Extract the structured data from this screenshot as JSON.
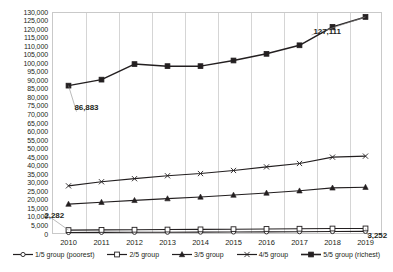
{
  "chart_data": {
    "type": "line",
    "title": "",
    "subtitle": "",
    "xlabel": "",
    "ylabel": "",
    "x": [
      "2010",
      "2011",
      "2012",
      "2013",
      "2014",
      "2015",
      "2016",
      "2017",
      "2018",
      "2019"
    ],
    "categories": [
      "2010",
      "2011",
      "2012",
      "2013",
      "2014",
      "2015",
      "2016",
      "2017",
      "2018",
      "2019"
    ],
    "ylim": [
      0,
      130000
    ],
    "ytick_step": 5000,
    "yticks": [
      "130,000",
      "125,000",
      "120,000",
      "115,000",
      "110,000",
      "105,000",
      "100,000",
      "95,000",
      "90,000",
      "85,000",
      "80,000",
      "75,000",
      "70,000",
      "65,000",
      "60,000",
      "55,000",
      "50,000",
      "45,000",
      "40,000",
      "35,000",
      "30,000",
      "25,000",
      "20,000",
      "15,000",
      "10,000",
      "5,000",
      "0"
    ],
    "ytick_values": [
      130000,
      125000,
      120000,
      115000,
      110000,
      105000,
      100000,
      95000,
      90000,
      85000,
      80000,
      75000,
      70000,
      65000,
      60000,
      55000,
      50000,
      45000,
      40000,
      35000,
      30000,
      25000,
      20000,
      15000,
      10000,
      5000,
      0
    ],
    "grid": {
      "vertical": true,
      "horizontal": false
    },
    "legend_position": "bottom",
    "series": [
      {
        "name": "1/5 group (poorest)",
        "marker": "open-circle",
        "color": "#231f20",
        "values": [
          900,
          950,
          1000,
          1050,
          1100,
          1180,
          1250,
          1350,
          1450,
          1550
        ]
      },
      {
        "name": "2/5 group",
        "marker": "open-square",
        "color": "#231f20",
        "values": [
          2282,
          2400,
          2500,
          2600,
          2700,
          2820,
          2950,
          3080,
          3200,
          3252
        ]
      },
      {
        "name": "3/5 group",
        "marker": "filled-triangle",
        "color": "#231f20",
        "values": [
          17500,
          18600,
          19700,
          20700,
          21700,
          22800,
          24000,
          25300,
          27000,
          27400
        ]
      },
      {
        "name": "4/5 group",
        "marker": "cross-bar",
        "color": "#231f20",
        "values": [
          28200,
          30600,
          32400,
          34100,
          35400,
          37200,
          39300,
          41300,
          45000,
          45600
        ]
      },
      {
        "name": "5/5 group (richest)",
        "marker": "filled-square",
        "color": "#231f20",
        "values": [
          86883,
          90400,
          99500,
          98300,
          98300,
          101600,
          105500,
          110500,
          121300,
          127111
        ]
      }
    ],
    "annotations": [
      {
        "text": "86,883",
        "series": "5/5 group (richest)",
        "x": "2010",
        "value": 86883
      },
      {
        "text": "127,111",
        "series": "5/5 group (richest)",
        "x": "2019",
        "value": 127111
      },
      {
        "text": "2,282",
        "series": "2/5 group",
        "x": "2010",
        "value": 2282
      },
      {
        "text": "3,252",
        "series": "2/5 group",
        "x": "2019",
        "value": 3252
      }
    ]
  },
  "legend": {
    "items": [
      {
        "label": "1/5 group (poorest)",
        "marker": "open-circle"
      },
      {
        "label": "2/5 group",
        "marker": "open-square"
      },
      {
        "label": "3/5 group",
        "marker": "filled-triangle"
      },
      {
        "label": "4/5 group",
        "marker": "cross-bar"
      },
      {
        "label": "5/5 group (richest)",
        "marker": "filled-square"
      }
    ]
  }
}
